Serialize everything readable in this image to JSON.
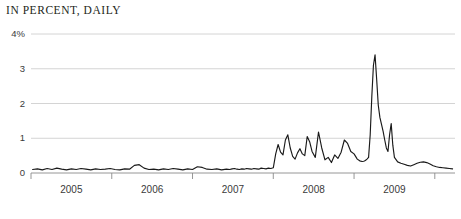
{
  "chart_data": {
    "type": "line",
    "title": "IN PERCENT, DAILY",
    "xlabel": "",
    "ylabel": "",
    "grid": true,
    "legend": "none",
    "xlim": [
      2004.5,
      2009.75
    ],
    "ylim": [
      0,
      4
    ],
    "y_ticks": [
      {
        "value": 4,
        "label": "4%"
      },
      {
        "value": 3,
        "label": "3"
      },
      {
        "value": 2,
        "label": "2"
      },
      {
        "value": 1,
        "label": "1"
      },
      {
        "value": 0,
        "label": "0"
      }
    ],
    "x_ticks": [
      2004.5,
      2005.5,
      2006.5,
      2007.5,
      2008.5,
      2009.5
    ],
    "x_tick_labels": [
      "2005",
      "2006",
      "2007",
      "2008",
      "2009"
    ],
    "series": [
      {
        "name": "spread",
        "color": "#1a1a1a",
        "x": [
          2004.52,
          2004.58,
          2004.64,
          2004.7,
          2004.76,
          2004.82,
          2004.88,
          2004.94,
          2005.0,
          2005.06,
          2005.12,
          2005.18,
          2005.24,
          2005.3,
          2005.36,
          2005.42,
          2005.48,
          2005.54,
          2005.6,
          2005.66,
          2005.72,
          2005.78,
          2005.84,
          2005.9,
          2005.96,
          2006.02,
          2006.08,
          2006.14,
          2006.2,
          2006.26,
          2006.32,
          2006.38,
          2006.44,
          2006.5,
          2006.56,
          2006.62,
          2006.68,
          2006.74,
          2006.8,
          2006.86,
          2006.92,
          2006.96,
          2006.99,
          2007.02,
          2007.05,
          2007.08,
          2007.11,
          2007.14,
          2007.17,
          2007.2,
          2007.23,
          2007.26,
          2007.29,
          2007.32,
          2007.35,
          2007.38,
          2007.41,
          2007.44,
          2007.47,
          2007.5,
          2007.53,
          2007.56,
          2007.59,
          2007.62,
          2007.65,
          2007.68,
          2007.71,
          2007.74,
          2007.77,
          2007.8,
          2007.83,
          2007.86,
          2007.89,
          2007.92,
          2007.95,
          2007.98,
          2008.02,
          2008.06,
          2008.1,
          2008.14,
          2008.18,
          2008.22,
          2008.26,
          2008.3,
          2008.34,
          2008.38,
          2008.42,
          2008.46,
          2008.5,
          2008.54,
          2008.57,
          2008.6,
          2008.62,
          2008.64,
          2008.66,
          2008.68,
          2008.7,
          2008.72,
          2008.74,
          2008.76,
          2008.78,
          2008.8,
          2008.82,
          2008.84,
          2008.86,
          2008.88,
          2008.9,
          2008.92,
          2008.94,
          2008.96,
          2008.98,
          2009.0,
          2009.04,
          2009.08,
          2009.12,
          2009.16,
          2009.2,
          2009.24,
          2009.28,
          2009.32,
          2009.36,
          2009.4,
          2009.44,
          2009.48,
          2009.52,
          2009.56,
          2009.6,
          2009.64,
          2009.68,
          2009.72
        ],
        "values": [
          0.1,
          0.12,
          0.09,
          0.13,
          0.1,
          0.14,
          0.11,
          0.09,
          0.12,
          0.1,
          0.13,
          0.11,
          0.09,
          0.12,
          0.1,
          0.11,
          0.13,
          0.1,
          0.09,
          0.12,
          0.11,
          0.22,
          0.24,
          0.14,
          0.1,
          0.11,
          0.09,
          0.12,
          0.1,
          0.13,
          0.11,
          0.09,
          0.12,
          0.1,
          0.18,
          0.16,
          0.11,
          0.1,
          0.12,
          0.09,
          0.11,
          0.1,
          0.12,
          0.13,
          0.11,
          0.1,
          0.12,
          0.11,
          0.13,
          0.12,
          0.11,
          0.13,
          0.12,
          0.11,
          0.14,
          0.13,
          0.12,
          0.14,
          0.13,
          0.15,
          0.55,
          0.82,
          0.6,
          0.52,
          0.95,
          1.1,
          0.72,
          0.48,
          0.4,
          0.58,
          0.7,
          0.55,
          0.5,
          1.05,
          0.9,
          0.62,
          0.45,
          1.18,
          0.72,
          0.38,
          0.45,
          0.3,
          0.52,
          0.42,
          0.6,
          0.95,
          0.85,
          0.62,
          0.55,
          0.4,
          0.35,
          0.33,
          0.34,
          0.36,
          0.4,
          0.45,
          1.1,
          2.2,
          3.1,
          3.4,
          2.7,
          1.95,
          1.6,
          1.4,
          1.2,
          0.95,
          0.72,
          0.62,
          1.1,
          1.42,
          0.8,
          0.45,
          0.32,
          0.28,
          0.25,
          0.22,
          0.2,
          0.24,
          0.28,
          0.31,
          0.32,
          0.3,
          0.26,
          0.21,
          0.18,
          0.16,
          0.15,
          0.14,
          0.13,
          0.12
        ]
      }
    ]
  },
  "style": {
    "grid_color": "#c9c9c9",
    "axis_color": "#8a8a8a",
    "line_color": "#1a1a1a",
    "text_color": "#3a3a3a",
    "title_color": "#231f20",
    "background": "#ffffff"
  }
}
